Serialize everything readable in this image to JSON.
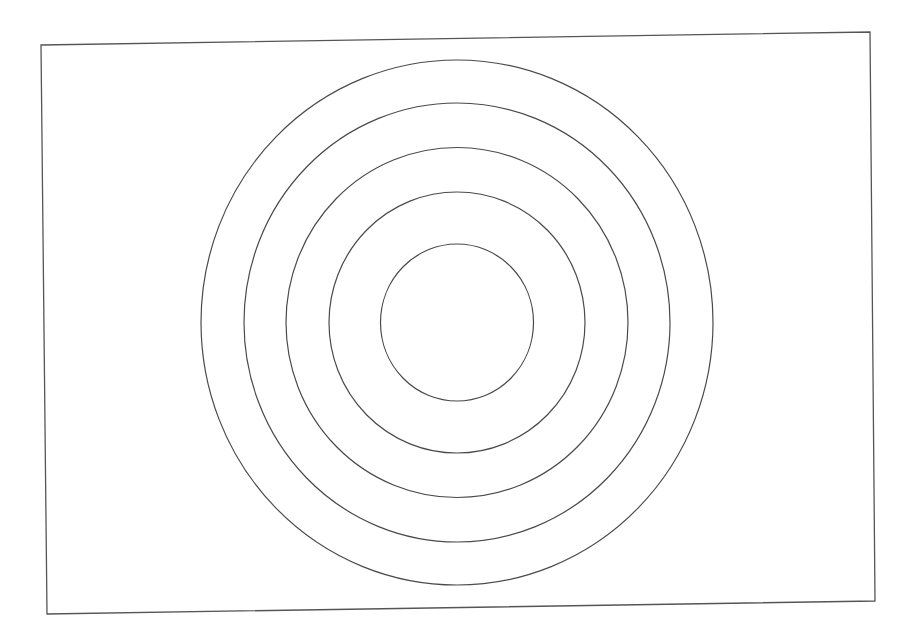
{
  "diagram": {
    "type": "concentric-circles",
    "stroke_color": "#4a4a4a",
    "background": "#ffffff",
    "frame": {
      "points": "41,45 870,32 875,601 47,614",
      "stroke_color": "#555555"
    },
    "center": {
      "x": 457,
      "y": 322.5
    },
    "circles": [
      {
        "rx": 76.5,
        "ry": 78.5
      },
      {
        "rx": 128,
        "ry": 130.5
      },
      {
        "rx": 171,
        "ry": 175
      },
      {
        "rx": 213,
        "ry": 219.5
      },
      {
        "rx": 256,
        "ry": 262.5
      }
    ]
  }
}
